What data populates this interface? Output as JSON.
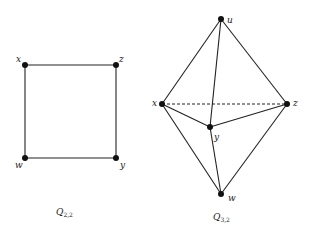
{
  "diagrams": [
    {
      "id": "Q22",
      "caption": {
        "main": "Q",
        "sub": "2,2"
      },
      "vertices": [
        {
          "name": "x",
          "cx": 25,
          "cy": 65
        },
        {
          "name": "z",
          "cx": 116,
          "cy": 65
        },
        {
          "name": "w",
          "cx": 25,
          "cy": 158
        },
        {
          "name": "y",
          "cx": 116,
          "cy": 158
        }
      ],
      "edges": [
        [
          "x",
          "z"
        ],
        [
          "z",
          "y"
        ],
        [
          "y",
          "w"
        ],
        [
          "w",
          "x"
        ]
      ]
    },
    {
      "id": "Q32",
      "caption": {
        "main": "Q",
        "sub": "3,2"
      },
      "vertices": [
        {
          "name": "u",
          "cx": 221,
          "cy": 19
        },
        {
          "name": "x",
          "cx": 162,
          "cy": 104
        },
        {
          "name": "z",
          "cx": 287,
          "cy": 104
        },
        {
          "name": "y",
          "cx": 210,
          "cy": 127
        },
        {
          "name": "w",
          "cx": 221,
          "cy": 194
        }
      ],
      "edges": [
        [
          "u",
          "x"
        ],
        [
          "u",
          "z"
        ],
        [
          "u",
          "y"
        ],
        [
          "x",
          "y"
        ],
        [
          "y",
          "z"
        ],
        [
          "x",
          "w"
        ],
        [
          "z",
          "w"
        ],
        [
          "y",
          "w"
        ]
      ],
      "dashed_edges": [
        [
          "x",
          "z"
        ]
      ]
    }
  ]
}
